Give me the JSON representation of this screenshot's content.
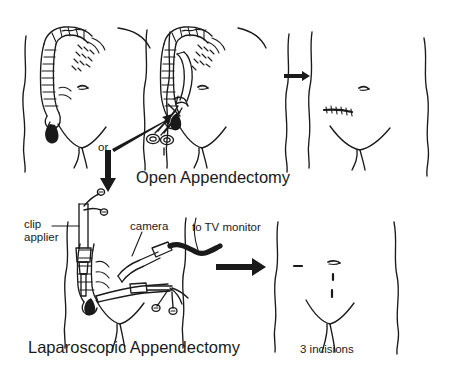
{
  "figure": {
    "title_open": "Open Appendectomy",
    "title_lap": "Laparoscopic Appendectomy",
    "connector_or": "or",
    "ink_color": "#1a1a1a",
    "background_color": "#ffffff"
  },
  "labels": {
    "clip_applier": "clip\napplier",
    "camera": "camera",
    "to_tv_monitor": "to TV monitor",
    "three_incisions": "3 incisions"
  },
  "panels": [
    {
      "id": "panel-anatomy",
      "row": "open",
      "position": 1,
      "description": "Abdomen with ascending colon, transverse colon, cecum and inflamed appendix",
      "features": [
        "torso-outline",
        "ascending-colon",
        "transverse-colon",
        "navel",
        "inflamed-appendix",
        "groin-crease"
      ]
    },
    {
      "id": "panel-open-surgery",
      "row": "open",
      "position": 2,
      "description": "Open appendectomy: large right lower quadrant incision with ring-handled forceps removing appendix",
      "features": [
        "torso-outline",
        "colon",
        "incision-line",
        "ring-forceps",
        "appendix",
        "pointer-arrow"
      ]
    },
    {
      "id": "panel-open-result",
      "row": "open",
      "position": 3,
      "description": "Healed abdomen with a single long sutured scar in the right lower quadrant",
      "features": [
        "torso-outline",
        "navel",
        "sutured-scar",
        "groin-crease"
      ]
    },
    {
      "id": "panel-lap-surgery",
      "row": "laparoscopic",
      "position": 1,
      "description": "Laparoscopic appendectomy: clip applier, camera with cable to TV monitor, and grasper through three small ports",
      "features": [
        "torso-outline",
        "colon",
        "clip-applier",
        "camera",
        "camera-cable",
        "grasper",
        "appendix"
      ]
    },
    {
      "id": "panel-lap-result",
      "row": "laparoscopic",
      "position": 2,
      "description": "Healed abdomen with three small incision marks",
      "features": [
        "torso-outline",
        "navel",
        "small-scar",
        "port-marks",
        "groin-crease"
      ]
    }
  ],
  "arrows": [
    {
      "id": "arrow-or-down",
      "direction": "down",
      "from": "panel-anatomy",
      "to": "panel-lap-surgery",
      "style": "thick"
    },
    {
      "id": "arrow-to-incision",
      "direction": "up-right",
      "from": "or-branch",
      "to": "panel-open-surgery",
      "style": "thin-wedge"
    },
    {
      "id": "arrow-open-result",
      "direction": "right",
      "from": "panel-open-surgery",
      "to": "panel-open-result",
      "style": "small"
    },
    {
      "id": "arrow-lap-result",
      "direction": "right",
      "from": "panel-lap-surgery",
      "to": "panel-lap-result",
      "style": "thick"
    }
  ]
}
